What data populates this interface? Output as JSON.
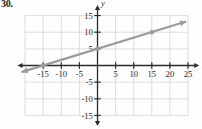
{
  "exercise": {
    "number": "30."
  },
  "chart_data": {
    "type": "line",
    "title": "",
    "xlabel": "x",
    "ylabel": "y",
    "xlim": [
      -21,
      27
    ],
    "ylim": [
      -17,
      17
    ],
    "xticks": [
      -15,
      -10,
      -5,
      5,
      10,
      15,
      20,
      25
    ],
    "yticks": [
      15,
      10,
      5,
      -5,
      -10,
      -15
    ],
    "xtick_labels": [
      "-15",
      "-10",
      "-5",
      "5",
      "10",
      "15",
      "20",
      "25"
    ],
    "ytick_labels": [
      "15",
      "10",
      "5",
      "-5",
      "-10",
      "-15"
    ],
    "grid": true,
    "grid_spacing": 5,
    "grid_color": "#d0d0d0",
    "axis_color": "#2b2b2b",
    "legend": null,
    "series": [
      {
        "name": "line",
        "color": "#9a9a9a",
        "slope": 0.3333,
        "intercept": 5,
        "equation": "y = (1/3)x + 5",
        "x": [
          -15,
          0,
          15
        ],
        "values": [
          0,
          5,
          10
        ],
        "points": [
          [
            -15,
            0
          ],
          [
            0,
            5
          ],
          [
            15,
            10
          ]
        ],
        "draw_from": [
          -21,
          -2
        ],
        "draw_to": [
          24.5,
          13.2
        ],
        "arrow_start": true,
        "arrow_end": true,
        "marker": "dot"
      }
    ],
    "annotations": []
  }
}
